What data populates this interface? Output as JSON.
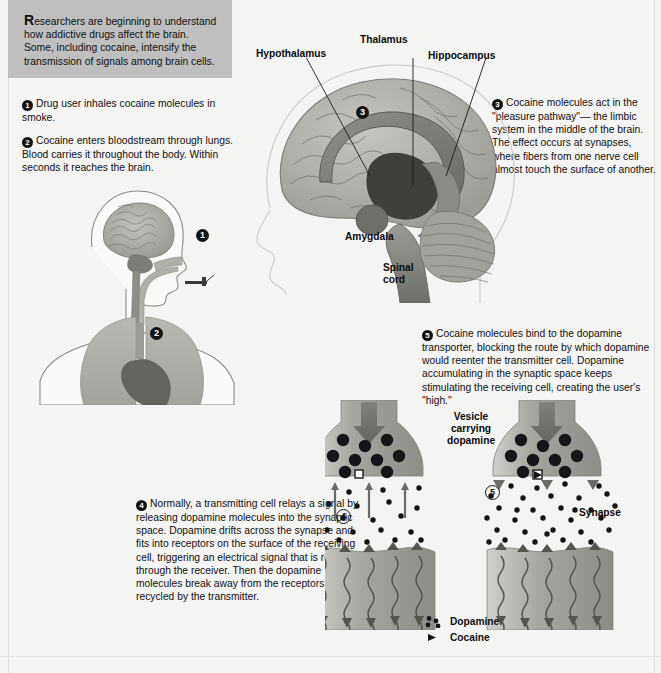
{
  "intro": {
    "dropcap": "R",
    "text": "esearchers are beginning to understand how addictive drugs affect the brain. Some, including cocaine, intensify the transmission of signals among brain cells."
  },
  "steps": [
    {
      "num": "1",
      "text": "Drug user inhales cocaine molecules in smoke."
    },
    {
      "num": "2",
      "text": "Cocaine enters bloodstream through lungs. Blood carries it throughout the body. Within seconds it reaches the brain."
    },
    {
      "num": "3",
      "text": "Cocaine molecules act in the \"pleasure pathway\"— the limbic system in the middle of the brain. The effect occurs at synapses, where fibers from one nerve cell almost touch the surface of another."
    },
    {
      "num": "4",
      "text": "Normally, a transmitting cell relays a signal by releasing dopamine molecules into the synaptic space. Dopamine drifts across the synapse and fits into receptors on the surface of the receiving cell, triggering an electrical signal that is relayed through the receiver. Then the dopamine molecules break away from the receptors and are recycled by the transmitter."
    },
    {
      "num": "5",
      "text": "Cocaine molecules bind to the dopamine transporter, blocking the route by which dopamine would reenter the transmitter cell. Dopamine accumulating in the synaptic space keeps stimulating the receiving cell, creating the user's \"high.\""
    }
  ],
  "brain_labels": {
    "hypothalamus": "Hypothalamus",
    "thalamus": "Thalamus",
    "hippocampus": "Hippocampus",
    "amygdala": "Amygdala",
    "spinal_cord": "Spinal\ncord"
  },
  "synapse_labels": {
    "vesicle": "Vesicle\ncarrying\ndopamine",
    "synapse": "Synapse"
  },
  "markers": {
    "inhale": "1",
    "lungs": "2",
    "brain": "3",
    "normal_synapse": "4",
    "cocaine_synapse": "5"
  },
  "legend": [
    {
      "key": "dopamine-swatch",
      "label": "Dopamine"
    },
    {
      "key": "cocaine-swatch",
      "label": "Cocaine"
    }
  ],
  "colors": {
    "page_bg": "#f4f4f2",
    "intro_bg": "#bfbfbf",
    "text": "#111111",
    "brain_mid": "#a9a9a4",
    "brain_dark": "#6e6e6c",
    "neuron": "#b2b2ae",
    "molecule": "#1b1b1b",
    "organ_lung": "#b4b4ae",
    "organ_dark": "#6c6c68"
  }
}
